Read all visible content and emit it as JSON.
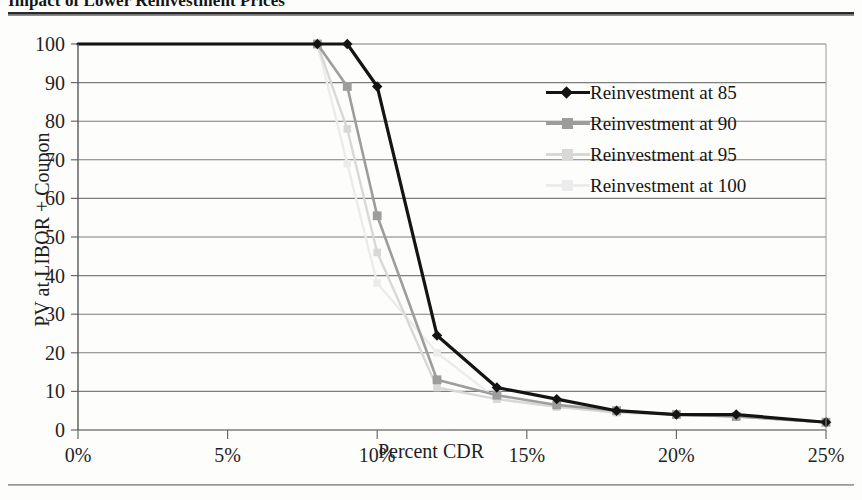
{
  "figure": {
    "title": "Impact of Lower Reinvestment Prices",
    "xlabel": "Percent CDR",
    "ylabel": "PV at LIBOR + Coupon"
  },
  "legend": {
    "position": "right-inside",
    "items": [
      {
        "label": "Reinvestment at 85",
        "color": "#141414",
        "marker": "diamond",
        "icon": "legend-line-diamond-icon"
      },
      {
        "label": "Reinvestment at 90",
        "color": "#9d9d9d",
        "marker": "square",
        "icon": "legend-line-square-icon"
      },
      {
        "label": "Reinvestment at 95",
        "color": "#d8d8d8",
        "marker": "square",
        "icon": "legend-line-square-icon"
      },
      {
        "label": "Reinvestment at 100",
        "color": "#ececec",
        "marker": "square",
        "icon": "legend-line-square-icon"
      }
    ]
  },
  "axes": {
    "y_ticks": [
      "0",
      "10",
      "20",
      "30",
      "40",
      "50",
      "60",
      "70",
      "80",
      "90",
      "100"
    ],
    "x_ticks": [
      "0%",
      "5%",
      "10%",
      "15%",
      "20%",
      "25%"
    ],
    "grid": "horizontal"
  },
  "chart_data": {
    "type": "line",
    "title": "Impact of Lower Reinvestment Prices",
    "xlabel": "Percent CDR",
    "ylabel": "PV at LIBOR + Coupon",
    "xlim": [
      0,
      25
    ],
    "ylim": [
      0,
      100
    ],
    "xtick_values": [
      0,
      5,
      10,
      15,
      20,
      25
    ],
    "ytick_values": [
      0,
      10,
      20,
      30,
      40,
      50,
      60,
      70,
      80,
      90,
      100
    ],
    "xtick_labels": [
      "0%",
      "5%",
      "10%",
      "15%",
      "20%",
      "25%"
    ],
    "ytick_labels": [
      "0",
      "10",
      "20",
      "30",
      "40",
      "50",
      "60",
      "70",
      "80",
      "90",
      "100"
    ],
    "grid": "horizontal",
    "legend_position": "right-inside",
    "series": [
      {
        "name": "Reinvestment at 85",
        "color": "#141414",
        "marker": "diamond",
        "x": [
          0,
          8,
          9,
          10,
          12,
          14,
          16,
          18,
          20,
          22,
          25
        ],
        "y": [
          100,
          100,
          100,
          89,
          24.5,
          11,
          8,
          5,
          4,
          4,
          2
        ]
      },
      {
        "name": "Reinvestment at 90",
        "color": "#9d9d9d",
        "marker": "square",
        "x": [
          0,
          8,
          9,
          10,
          12,
          14,
          16,
          18,
          20,
          22,
          25
        ],
        "y": [
          100,
          100,
          89,
          55.5,
          13,
          9,
          6.5,
          5,
          4,
          3.5,
          2
        ]
      },
      {
        "name": "Reinvestment at 95",
        "color": "#d8d8d8",
        "marker": "square",
        "x": [
          0,
          8,
          9,
          10,
          12,
          14,
          16,
          18,
          20,
          22,
          25
        ],
        "y": [
          100,
          100,
          78,
          46,
          11,
          8,
          6,
          4.5,
          4,
          3.5,
          2
        ]
      },
      {
        "name": "Reinvestment at 100",
        "color": "#ececec",
        "marker": "square",
        "x": [
          0,
          8,
          9,
          10,
          12,
          14,
          16,
          18,
          20,
          22,
          25
        ],
        "y": [
          100,
          100,
          69,
          38,
          20,
          8,
          6,
          4.5,
          4,
          3.5,
          2
        ]
      }
    ]
  }
}
